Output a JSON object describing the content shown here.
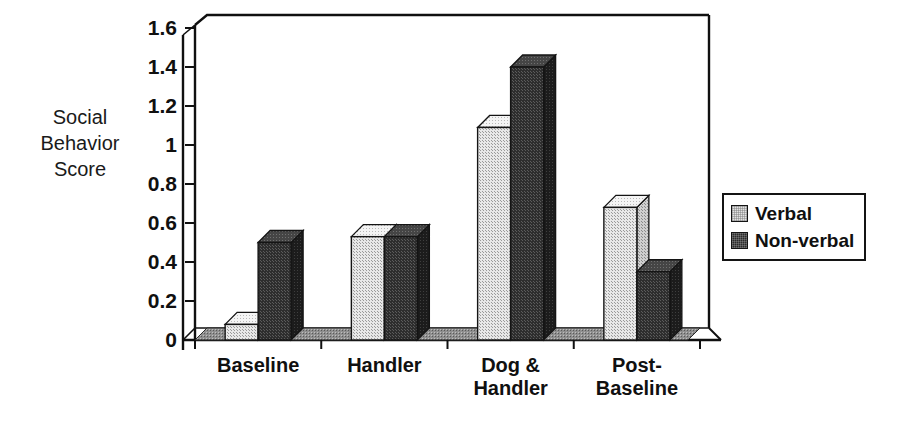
{
  "chart_data": {
    "type": "bar",
    "title": "",
    "subtitle": "",
    "xlabel": "",
    "ylabel": "Social Behavior Score",
    "ylabel_lines": [
      "Social",
      "Behavior",
      "Score"
    ],
    "categories": [
      "Baseline",
      "Handler",
      "Dog & Handler",
      "Post-Baseline"
    ],
    "category_lines": [
      [
        "Baseline"
      ],
      [
        "Handler"
      ],
      [
        "Dog &",
        "Handler"
      ],
      [
        "Post-",
        "Baseline"
      ]
    ],
    "series": [
      {
        "name": "Verbal",
        "values": [
          0.08,
          0.53,
          1.09,
          0.68
        ],
        "color": "#e2e2e2"
      },
      {
        "name": "Non-verbal",
        "values": [
          0.5,
          0.53,
          1.4,
          0.35
        ],
        "color": "#2b2b2b"
      }
    ],
    "ylim": [
      0,
      1.6
    ],
    "ytick_values": [
      0,
      0.2,
      0.4,
      0.6,
      0.8,
      1,
      1.2,
      1.4,
      1.6
    ],
    "ytick_labels": [
      "0",
      "0.2",
      "0.4",
      "0.6",
      "0.8",
      "1",
      "1.2",
      "1.4",
      "1.6"
    ],
    "grid": false,
    "legend_position": "right",
    "style": "3d-columns"
  },
  "legend": {
    "entries": [
      {
        "label": "Verbal",
        "swatch": "light-gray-square"
      },
      {
        "label": "Non-verbal",
        "swatch": "dark-gray-square"
      }
    ]
  },
  "colors": {
    "verbal_fill": "#e2e2e2",
    "verbal_top": "#f2f2f2",
    "verbal_side": "#c2c2c2",
    "nonverbal_fill": "#2b2b2b",
    "nonverbal_top": "#4a4a4a",
    "nonverbal_side": "#1a1a1a",
    "floor": "#8c8c8c",
    "axis": "#101010",
    "background": "#ffffff"
  }
}
